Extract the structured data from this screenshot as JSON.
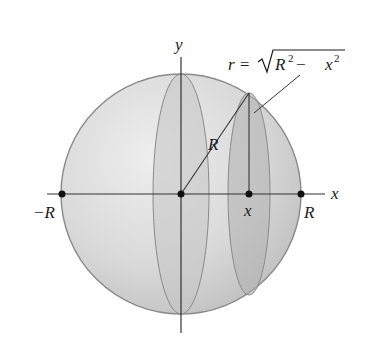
{
  "diagram": {
    "labels": {
      "y_axis": "y",
      "x_axis": "x",
      "radius": "R",
      "neg_R": "−R",
      "pos_R": "R",
      "x_point": "x",
      "formula_lhs": "r =",
      "formula_R": "R",
      "formula_exp1": "2",
      "formula_minus": " − ",
      "formula_x": "x",
      "formula_exp2": "2"
    },
    "colors": {
      "sphere_fill": "#d6d6d6",
      "sphere_stroke": "#8a8a8a",
      "section_fill": "#b8b8b8",
      "axis": "#333333",
      "point": "#111111"
    }
  }
}
